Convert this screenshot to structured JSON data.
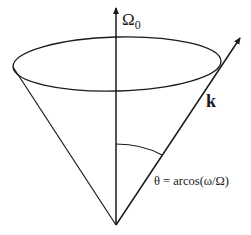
{
  "diagram": {
    "type": "cone-geometry",
    "colors": {
      "stroke": "#1a1a1a",
      "background": "#ffffff"
    },
    "axis_label": {
      "main": "Ω",
      "subscript": "0"
    },
    "vector_label": "k",
    "angle_label": "θ = arcos(ω/Ω)"
  }
}
